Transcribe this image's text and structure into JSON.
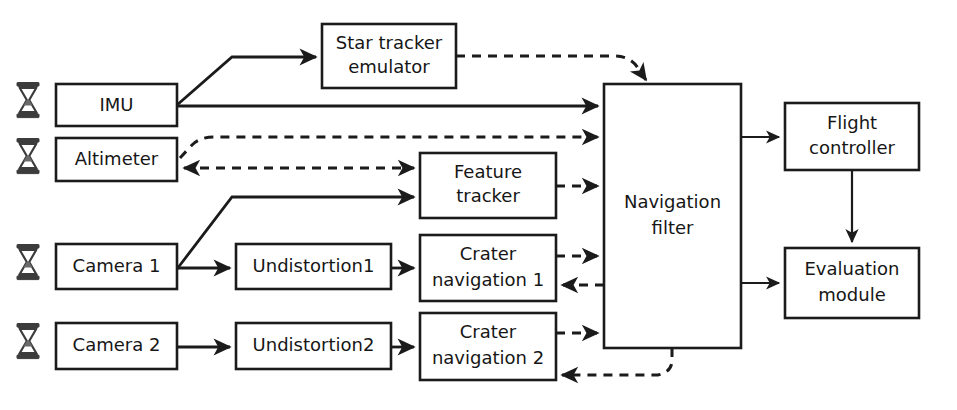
{
  "diagram": {
    "background_color": "#ffffff",
    "line_color": "#1b1b1b",
    "icon_color": "#3c3c3c",
    "nodes": [
      {
        "id": "imu",
        "label": "IMU",
        "line1": "IMU",
        "line2": "",
        "x": 56,
        "y": 84,
        "w": 121,
        "h": 42,
        "has_sensor_icon": true
      },
      {
        "id": "altimeter",
        "label": "Altimeter",
        "line1": "Altimeter",
        "line2": "",
        "x": 56,
        "y": 138,
        "w": 121,
        "h": 43,
        "has_sensor_icon": true
      },
      {
        "id": "camera1",
        "label": "Camera 1",
        "line1": "Camera 1",
        "line2": "",
        "x": 56,
        "y": 244,
        "w": 121,
        "h": 45,
        "has_sensor_icon": true
      },
      {
        "id": "camera2",
        "label": "Camera 2",
        "line1": "Camera 2",
        "line2": "",
        "x": 56,
        "y": 323,
        "w": 121,
        "h": 46,
        "has_sensor_icon": true
      },
      {
        "id": "star-tracker",
        "label": "Star tracker emulator",
        "line1": "Star tracker",
        "line2": "emulator",
        "x": 322,
        "y": 24,
        "w": 134,
        "h": 64,
        "has_sensor_icon": false
      },
      {
        "id": "undistortion1",
        "label": "Undistortion1",
        "line1": "Undistortion1",
        "line2": "",
        "x": 236,
        "y": 244,
        "w": 155,
        "h": 45,
        "has_sensor_icon": false
      },
      {
        "id": "undistortion2",
        "label": "Undistortion2",
        "line1": "Undistortion2",
        "line2": "",
        "x": 236,
        "y": 323,
        "w": 155,
        "h": 46,
        "has_sensor_icon": false
      },
      {
        "id": "feature-tracker",
        "label": "Feature tracker",
        "line1": "Feature",
        "line2": "tracker",
        "x": 420,
        "y": 153,
        "w": 136,
        "h": 65,
        "has_sensor_icon": false
      },
      {
        "id": "crater-nav-1",
        "label": "Crater navigation 1",
        "line1": "Crater",
        "line2": "navigation 1",
        "x": 420,
        "y": 235,
        "w": 136,
        "h": 66,
        "has_sensor_icon": false
      },
      {
        "id": "crater-nav-2",
        "label": "Crater navigation 2",
        "line1": "Crater",
        "line2": "navigation 2",
        "x": 420,
        "y": 313,
        "w": 136,
        "h": 67,
        "has_sensor_icon": false
      },
      {
        "id": "nav-filter",
        "label": "Navigation filter",
        "line1": "Navigation",
        "line2": "filter",
        "x": 604,
        "y": 84,
        "w": 137,
        "h": 264,
        "has_sensor_icon": false
      },
      {
        "id": "flight-controller",
        "label": "Flight controller",
        "line1": "Flight",
        "line2": "controller",
        "x": 785,
        "y": 103,
        "w": 134,
        "h": 67,
        "has_sensor_icon": false
      },
      {
        "id": "evaluation-module",
        "label": "Evaluation module",
        "line1": "Evaluation",
        "line2": "module",
        "x": 785,
        "y": 248,
        "w": 134,
        "h": 70,
        "has_sensor_icon": false
      }
    ],
    "edges": [
      {
        "id": "imu-to-star-tracker",
        "from": "imu",
        "to": "star-tracker",
        "style": "solid",
        "label": ""
      },
      {
        "id": "imu-to-nav-filter",
        "from": "imu",
        "to": "nav-filter",
        "style": "solid",
        "label": ""
      },
      {
        "id": "star-tracker-to-nav-filter",
        "from": "star-tracker",
        "to": "nav-filter",
        "style": "dashed",
        "label": ""
      },
      {
        "id": "altimeter-to-nav-filter",
        "from": "altimeter",
        "to": "nav-filter",
        "style": "dashed",
        "label": ""
      },
      {
        "id": "altimeter-to-feature-tracker",
        "from": "altimeter",
        "to": "feature-tracker",
        "style": "dashed",
        "label": ""
      },
      {
        "id": "camera1-to-feature-tracker",
        "from": "camera1",
        "to": "feature-tracker",
        "style": "solid",
        "label": ""
      },
      {
        "id": "camera1-to-undistortion1",
        "from": "camera1",
        "to": "undistortion1",
        "style": "solid",
        "label": ""
      },
      {
        "id": "camera2-to-undistortion2",
        "from": "camera2",
        "to": "undistortion2",
        "style": "solid",
        "label": ""
      },
      {
        "id": "undistortion1-to-crater-nav-1",
        "from": "undistortion1",
        "to": "crater-nav-1",
        "style": "solid",
        "label": ""
      },
      {
        "id": "undistortion2-to-crater-nav-2",
        "from": "undistortion2",
        "to": "crater-nav-2",
        "style": "solid",
        "label": ""
      },
      {
        "id": "feature-tracker-to-nav-filter",
        "from": "feature-tracker",
        "to": "nav-filter",
        "style": "dashed",
        "label": ""
      },
      {
        "id": "crater-nav-1-to-nav-filter",
        "from": "crater-nav-1",
        "to": "nav-filter",
        "style": "dashed",
        "label": ""
      },
      {
        "id": "nav-filter-to-crater-nav-1",
        "from": "nav-filter",
        "to": "crater-nav-1",
        "style": "dashed",
        "label": ""
      },
      {
        "id": "crater-nav-2-to-nav-filter",
        "from": "crater-nav-2",
        "to": "nav-filter",
        "style": "dashed",
        "label": ""
      },
      {
        "id": "nav-filter-to-crater-nav-2",
        "from": "nav-filter",
        "to": "crater-nav-2",
        "style": "dashed",
        "label": ""
      },
      {
        "id": "nav-filter-to-flight-controller",
        "from": "nav-filter",
        "to": "flight-controller",
        "style": "solid",
        "label": ""
      },
      {
        "id": "nav-filter-to-evaluation-module",
        "from": "nav-filter",
        "to": "evaluation-module",
        "style": "solid",
        "label": ""
      },
      {
        "id": "flight-controller-to-evaluation-module",
        "from": "flight-controller",
        "to": "evaluation-module",
        "style": "solid",
        "label": ""
      }
    ],
    "icons": {
      "sensor": "hourglass-icon"
    }
  }
}
